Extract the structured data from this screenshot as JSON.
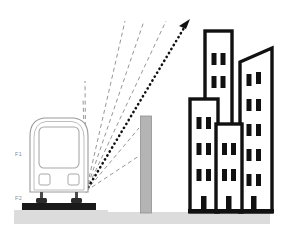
{
  "scene": {
    "title": "Train-to-building multipath radio propagation diagram",
    "width": 283,
    "height": 237,
    "background_color": "#ffffff"
  },
  "colors": {
    "outline_gray": "#8a8a8a",
    "train_outline": "#9a9a9a",
    "building_black": "#111111",
    "building_fill": "#ffffff",
    "wall_gray": "#b0b0b0",
    "wall_edge": "#8f8f8f",
    "ground_gray": "#d9d9d9",
    "rail_black": "#1a1a1a",
    "ray_dashed": "#8a8a8a",
    "ray_dotted": "#111111",
    "label_gray": "#8a8a8a"
  },
  "labels": {
    "antenna_label": "F1",
    "base_label": "F2"
  },
  "train": {
    "name": "train-front-view",
    "windshield": "windshield",
    "headlight_left": "headlight-left",
    "headlight_right": "headlight-right",
    "bogie_left": "bogie-left",
    "bogie_right": "bogie-right",
    "rail": "rail-base"
  },
  "wall": {
    "name": "gray-wall-pillar"
  },
  "ground": {
    "left_strip": "ground-left",
    "right_strip": "ground-right"
  },
  "rays": {
    "dashed_count": 6,
    "dotted_count": 1,
    "origin_x": 86,
    "origin_y": 191,
    "dashed": [
      {
        "name": "ray-dashed-1",
        "x1": 86,
        "y1": 191,
        "x2": 84,
        "y2": 98
      },
      {
        "name": "ray-dashed-2",
        "x1": 86,
        "y1": 191,
        "x2": 86,
        "y2": 81
      },
      {
        "name": "ray-dashed-3",
        "x1": 86,
        "y1": 191,
        "x2": 127,
        "y2": 21
      },
      {
        "name": "ray-dashed-4",
        "x1": 86,
        "y1": 191,
        "x2": 145,
        "y2": 21
      },
      {
        "name": "ray-dashed-5",
        "x1": 86,
        "y1": 191,
        "x2": 166,
        "y2": 21
      },
      {
        "name": "ray-reflect-a",
        "x1": 86,
        "y1": 191,
        "x2": 140,
        "y2": 127
      },
      {
        "name": "ray-reflect-b",
        "x1": 86,
        "y1": 191,
        "x2": 140,
        "y2": 155
      }
    ],
    "dotted_ray": {
      "name": "ray-dotted-main",
      "x1": 86,
      "y1": 191,
      "x2": 188,
      "y2": 22,
      "arrowhead": "arrowhead-up-right"
    }
  },
  "buildings": [
    {
      "name": "building-tall-tower",
      "x": 205,
      "y": 31,
      "w": 27,
      "h": 100,
      "window_rows": 2,
      "window_cols": 2,
      "has_door": false,
      "roof": "flat"
    },
    {
      "name": "building-right-slanted",
      "x": 240,
      "y": 48,
      "w": 32,
      "h": 164,
      "window_rows": 5,
      "window_cols": 2,
      "has_door": true,
      "roof": "slanted"
    },
    {
      "name": "building-left-mid",
      "x": 190,
      "y": 99,
      "w": 28,
      "h": 113,
      "window_rows": 3,
      "window_cols": 2,
      "has_door": true,
      "roof": "flat"
    },
    {
      "name": "building-center-front",
      "x": 216,
      "y": 124,
      "w": 26,
      "h": 88,
      "window_rows": 2,
      "window_cols": 2,
      "has_door": true,
      "roof": "flat"
    }
  ]
}
